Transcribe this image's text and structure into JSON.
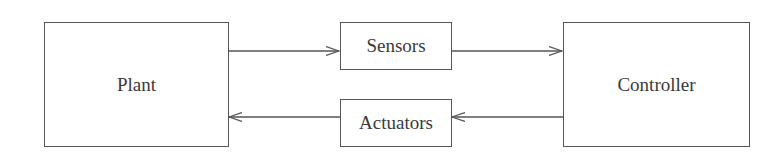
{
  "diagram": {
    "type": "block-diagram",
    "nodes": [
      {
        "id": "plant",
        "label": "Plant"
      },
      {
        "id": "sensors",
        "label": "Sensors"
      },
      {
        "id": "controller",
        "label": "Controller"
      },
      {
        "id": "actuators",
        "label": "Actuators"
      }
    ],
    "edges": [
      {
        "from": "plant",
        "to": "sensors"
      },
      {
        "from": "sensors",
        "to": "controller"
      },
      {
        "from": "controller",
        "to": "actuators"
      },
      {
        "from": "actuators",
        "to": "plant"
      }
    ]
  },
  "colors": {
    "stroke": "#555555",
    "text": "#3a3a3a",
    "background": "#ffffff"
  }
}
